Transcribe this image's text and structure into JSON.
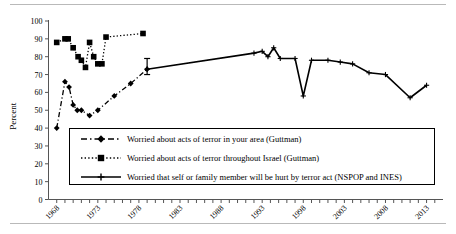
{
  "chart_data": {
    "type": "line",
    "title": "",
    "xlabel": "",
    "ylabel": "Percent",
    "ylim": [
      0,
      100
    ],
    "ytick_values": [
      0,
      10,
      20,
      30,
      40,
      50,
      60,
      70,
      80,
      90,
      100
    ],
    "ytick_labels": [
      "0",
      "10",
      "20",
      "30",
      "40",
      "50",
      "60",
      "70",
      "80",
      "90",
      "100"
    ],
    "xlim": [
      1967,
      2015
    ],
    "xtick_labels": [
      "1968",
      "1973",
      "1978",
      "1983",
      "1988",
      "1993",
      "1998",
      "2003",
      "2008",
      "2013"
    ],
    "xtick_values": [
      1968,
      1973,
      1978,
      1983,
      1988,
      1993,
      1998,
      2003,
      2008,
      2013
    ],
    "xtick_minor_step": 1,
    "grid": false,
    "legend_position": "inside-lower-center",
    "series": [
      {
        "name": "Worried about acts of terror in your area (Guttman)",
        "key": "guttman_area",
        "marker": "diamond",
        "linestyle": "dash-dot",
        "color": "#000000",
        "x": [
          1968,
          1969,
          1969.5,
          1970,
          1970.5,
          1971,
          1972,
          1973,
          1975,
          1977,
          1979
        ],
        "y": [
          40,
          66,
          63,
          53,
          50,
          50,
          47,
          50,
          58,
          65,
          73
        ]
      },
      {
        "name": "Worried about acts of terror throughout Israel (Guttman)",
        "key": "guttman_israel",
        "marker": "square",
        "linestyle": "dotted",
        "color": "#000000",
        "x": [
          1968,
          1969,
          1969.4,
          1970,
          1970.6,
          1971,
          1971.5,
          1972,
          1972.5,
          1973,
          1973.5,
          1974,
          1978.5
        ],
        "y": [
          88,
          90,
          90,
          85,
          80,
          78,
          74,
          88,
          80,
          76,
          76,
          91,
          93
        ]
      },
      {
        "name": "Worried that self or family member will be hurt by terror act (NSPOP and INES)",
        "key": "nspop_ines",
        "marker": "cross",
        "linestyle": "solid",
        "color": "#000000",
        "x": [
          1979,
          1992,
          1993,
          1993.7,
          1994.4,
          1995.2,
          1997,
          1998,
          1999,
          2001,
          2002.5,
          2004,
          2006,
          2008,
          2011,
          2013
        ],
        "y": [
          73,
          82,
          83,
          80,
          85,
          79,
          79,
          58,
          78,
          78,
          77,
          76,
          71,
          70,
          57,
          64
        ],
        "errorbar": {
          "x": 1979,
          "y": 73,
          "low": 70,
          "high": 79
        }
      }
    ]
  },
  "legend": {
    "items": [
      {
        "label": "Worried about acts of terror in your area (Guttman)",
        "swatch": "dash-dot-diamond"
      },
      {
        "label": "Worried about acts of terror throughout Israel (Guttman)",
        "swatch": "dotted-square"
      },
      {
        "label": "Worried that self or family member will be hurt by terror act (NSPOP and INES)",
        "swatch": "solid-cross"
      }
    ]
  }
}
